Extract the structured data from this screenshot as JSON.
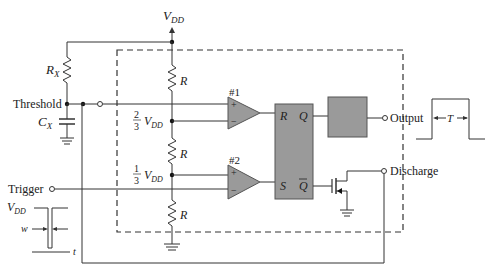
{
  "diagram": {
    "supply": {
      "label_main": "V",
      "label_sub": "DD"
    },
    "external": {
      "rx": {
        "label_main": "R",
        "label_sub": "X"
      },
      "cx": {
        "label_main": "C",
        "label_sub": "X"
      }
    },
    "pins": {
      "threshold": "Threshold",
      "trigger": "Trigger",
      "output": "Output",
      "discharge": "Discharge"
    },
    "divider": {
      "resistor_label": "R",
      "node_upper": {
        "num": "2",
        "den": "3",
        "v_main": "V",
        "v_sub": "DD"
      },
      "node_lower": {
        "num": "1",
        "den": "3",
        "v_main": "V",
        "v_sub": "DD"
      }
    },
    "comparators": [
      {
        "id": "#1",
        "plus": "+",
        "minus": "−"
      },
      {
        "id": "#2",
        "plus": "+",
        "minus": "−"
      }
    ],
    "flipflop": {
      "r": "R",
      "s": "S",
      "q": "Q",
      "qbar": "Q"
    },
    "output_pulse": {
      "period_label": "T"
    },
    "trigger_pulse": {
      "level_main": "V",
      "level_sub": "DD",
      "width_label": "w",
      "time_label": "t"
    },
    "colors": {
      "block_fill": "#9a9a9a",
      "line": "#333333"
    }
  }
}
